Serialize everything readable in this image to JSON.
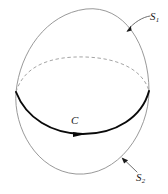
{
  "figure": {
    "kind": "mathematical-diagram",
    "background_color": "#ffffff",
    "labels": {
      "upper_surface": "S",
      "upper_surface_sub": "1",
      "lower_surface": "S",
      "lower_surface_sub": "2",
      "curve": "C"
    },
    "colors": {
      "thin_line": "#8d8d8d",
      "dashed_line": "#9a9a9a",
      "curve": "#0a0a0a",
      "leader": "#4a4a4a",
      "text": "#1a1a1a"
    },
    "geometry": {
      "left_junction": [
        16,
        92
      ],
      "right_junction": [
        149,
        91
      ],
      "upper_apex": [
        86,
        9
      ],
      "lower_apex": [
        76,
        174
      ],
      "curve_low_point": [
        83,
        134
      ],
      "dashed_arc_top": [
        85,
        57
      ],
      "s1_arrow_tip": [
        127,
        31
      ],
      "s2_arrow_tip": [
        122,
        159
      ],
      "curve_arrow_at": [
        78,
        137
      ]
    }
  }
}
